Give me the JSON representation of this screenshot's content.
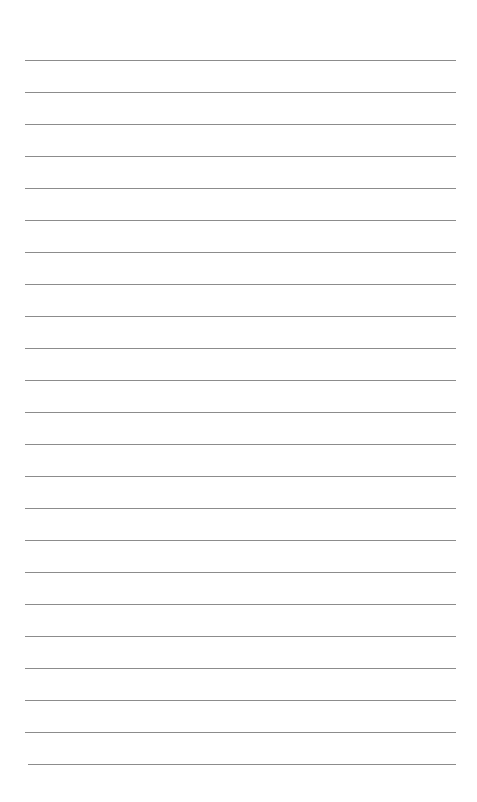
{
  "page": {
    "type": "lined-paper",
    "background_color": "#ffffff",
    "line_color": "#8c8c8c",
    "line_count": 23,
    "first_line_y": 60,
    "line_spacing": 32,
    "line_left": 25,
    "line_right": 456,
    "text": []
  }
}
